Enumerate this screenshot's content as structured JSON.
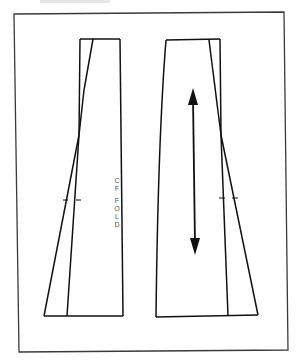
{
  "diagram": {
    "type": "sewing-pattern",
    "frame": {
      "stroke": "#333333"
    },
    "line_color": "#111111",
    "pieces": [
      {
        "name": "front-piece",
        "label_lines": [
          "C",
          "F",
          "",
          "F",
          "O",
          "L",
          "D"
        ],
        "label_text": "CF FOLD"
      },
      {
        "name": "back-piece",
        "grainline": "double-headed-arrow"
      }
    ]
  }
}
